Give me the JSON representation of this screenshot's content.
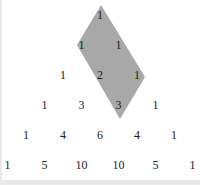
{
  "rows": [
    [
      "1"
    ],
    [
      "1",
      "1"
    ],
    [
      "1",
      "2",
      "1"
    ],
    [
      "1",
      "3",
      "3",
      "1"
    ],
    [
      "1",
      "4",
      "6",
      "4",
      "1"
    ],
    [
      "1",
      "5",
      "10",
      "10",
      "5",
      "1"
    ]
  ],
  "highlight": {
    "shape": "parallelogram",
    "color": "#a8a8a8",
    "vertices": [
      [
        101,
        5
      ],
      [
        77,
        45
      ],
      [
        120,
        119
      ],
      [
        145,
        77
      ]
    ],
    "covers": [
      "row0:1",
      "row1:1",
      "row1:1",
      "row2:2",
      "row2:1",
      "row3:3"
    ]
  },
  "colors": {
    "background": "#ffffff",
    "frame": "#e9e9e9",
    "text": "#222222"
  }
}
